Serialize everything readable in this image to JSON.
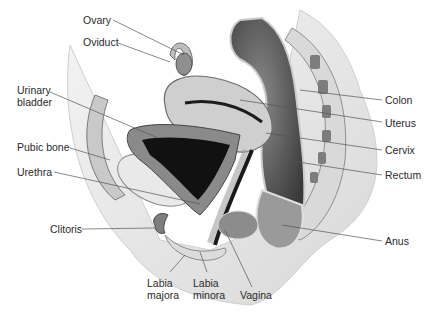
{
  "figure": {
    "labels": {
      "ovary": "Ovary",
      "oviduct": "Oviduct",
      "urinary_bladder_1": "Urinary",
      "urinary_bladder_2": "bladder",
      "pubic_bone": "Pubic bone",
      "urethra": "Urethra",
      "clitoris": "Clitoris",
      "labia_majora_1": "Labia",
      "labia_majora_2": "majora",
      "labia_minora_1": "Labia",
      "labia_minora_2": "minora",
      "vagina": "Vagina",
      "anus": "Anus",
      "rectum": "Rectum",
      "cervix": "Cervix",
      "uterus": "Uterus",
      "colon": "Colon"
    },
    "colors": {
      "background": "#ffffff",
      "label_text": "#2a2a2a",
      "leader_line": "#555555",
      "tissue_light": "#e6e6e6",
      "tissue_mid": "#b5b5b5",
      "tissue_dark": "#5a5a5a",
      "cavity": "#111111"
    }
  }
}
